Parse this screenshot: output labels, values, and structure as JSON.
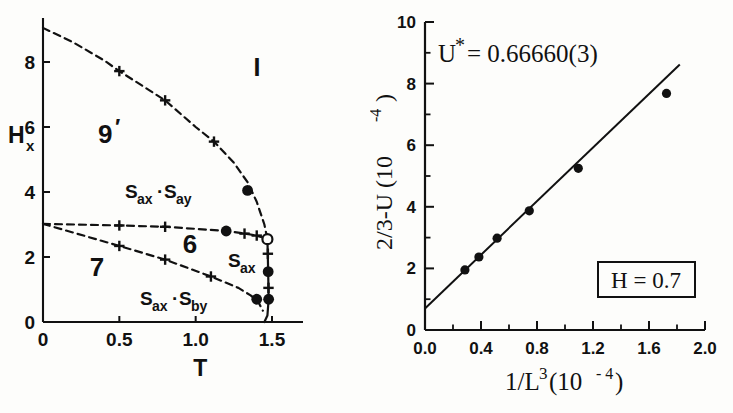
{
  "figure": {
    "panels": [
      "phase-diagram",
      "scaling-plot"
    ]
  },
  "left_panel": {
    "xlabel": "T",
    "ylabel_main": "H",
    "ylabel_sub": "x",
    "xticks": [
      "0",
      "0.5",
      "1.0",
      "1.5"
    ],
    "yticks": [
      "0",
      "2",
      "4",
      "6",
      "8"
    ],
    "regions": [
      {
        "name": "region-I",
        "label": "I"
      },
      {
        "name": "region-9prime",
        "label": "9",
        "prime": "′"
      },
      {
        "name": "region-sax-say",
        "label": "S",
        "sub1": "ax",
        "dot": "·",
        "label2": "S",
        "sub2": "ay"
      },
      {
        "name": "region-6",
        "label": "6"
      },
      {
        "name": "region-7",
        "label": "7"
      },
      {
        "name": "region-sax",
        "label": "S",
        "sub": "ax"
      },
      {
        "name": "region-sax-sby",
        "label": "S",
        "sub1": "ax",
        "dot": "·",
        "label2": "S",
        "sub2": "by"
      }
    ]
  },
  "right_panel": {
    "annotation_u": "U",
    "annotation_u_star": "*",
    "annotation_u_rest": " = 0.66660(3)",
    "boxed_label": "H = 0.7",
    "xticks": [
      "0.0",
      "0.4",
      "0.8",
      "1.2",
      "1.6",
      "2.0"
    ],
    "yticks": [
      "0",
      "2",
      "4",
      "6",
      "8",
      "10"
    ],
    "xlabel_main": "1/L",
    "xlabel_exp": "3",
    "xlabel_unit_open": " (10",
    "xlabel_unit_exp": "- 4",
    "xlabel_unit_close": " )",
    "ylabel_main": "2/3-U (10",
    "ylabel_exp": "-4",
    "ylabel_close": " )"
  },
  "chart_data": [
    {
      "type": "line",
      "name": "phase-diagram",
      "title": "",
      "xlabel": "T",
      "ylabel": "Hx",
      "xlim": [
        0.0,
        1.72
      ],
      "ylim": [
        0.0,
        9.6
      ],
      "xticks": [
        0.0,
        0.5,
        1.0,
        1.5
      ],
      "yticks": [
        0,
        2,
        4,
        6,
        8
      ],
      "grid": false,
      "legend": "none",
      "series": [
        {
          "name": "upper-boundary-9prime-I",
          "style": "dashed",
          "points": [
            [
              0.0,
              9.05
            ],
            [
              0.2,
              8.6
            ],
            [
              0.4,
              8.05
            ],
            [
              0.5,
              7.72
            ],
            [
              0.7,
              7.12
            ],
            [
              0.8,
              6.82
            ],
            [
              1.0,
              6.0
            ],
            [
              1.12,
              5.55
            ],
            [
              1.25,
              4.9
            ],
            [
              1.34,
              4.3
            ],
            [
              1.4,
              3.7
            ],
            [
              1.45,
              3.0
            ],
            [
              1.47,
              2.55
            ]
          ],
          "cross_markers": [
            [
              0.5,
              7.72
            ],
            [
              0.8,
              6.82
            ],
            [
              1.12,
              5.55
            ]
          ],
          "filled_markers": [
            [
              1.34,
              4.05
            ]
          ]
        },
        {
          "name": "middle-boundary-6",
          "style": "dashed",
          "points": [
            [
              0.0,
              3.02
            ],
            [
              0.5,
              2.97
            ],
            [
              0.8,
              2.93
            ],
            [
              1.2,
              2.8
            ],
            [
              1.32,
              2.72
            ],
            [
              1.4,
              2.66
            ],
            [
              1.47,
              2.55
            ]
          ],
          "cross_markers": [
            [
              0.5,
              2.97
            ],
            [
              0.8,
              2.93
            ],
            [
              1.32,
              2.72
            ],
            [
              1.4,
              2.66
            ]
          ],
          "filled_markers": [
            [
              1.2,
              2.8
            ]
          ]
        },
        {
          "name": "lower-boundary-7",
          "style": "dashed",
          "points": [
            [
              0.0,
              3.02
            ],
            [
              0.5,
              2.34
            ],
            [
              0.8,
              1.92
            ],
            [
              1.1,
              1.4
            ],
            [
              1.28,
              1.05
            ],
            [
              1.36,
              0.82
            ],
            [
              1.41,
              0.62
            ],
            [
              1.44,
              0.35
            ]
          ],
          "cross_markers": [
            [
              0.5,
              2.34
            ],
            [
              0.8,
              1.92
            ],
            [
              1.1,
              1.4
            ]
          ],
          "filled_markers": [
            [
              1.4,
              0.7
            ]
          ]
        },
        {
          "name": "critical-line-vertical",
          "style": "solid",
          "points": [
            [
              1.47,
              2.55
            ],
            [
              1.475,
              1.55
            ],
            [
              1.478,
              0.7
            ],
            [
              1.47,
              0.2
            ],
            [
              1.45,
              0.0
            ]
          ],
          "cross_markers": [
            [
              1.473,
              2.1
            ],
            [
              1.477,
              1.05
            ]
          ],
          "filled_markers": [
            [
              1.475,
              1.55
            ],
            [
              1.478,
              0.7
            ]
          ],
          "open_markers": [
            [
              1.47,
              2.55
            ]
          ]
        }
      ]
    },
    {
      "type": "scatter",
      "name": "scaling-plot",
      "title": "U* = 0.66660(3)",
      "xlabel": "1/L^3 (10^-4)",
      "ylabel": "2/3-U (10^-4)",
      "xlim": [
        0.0,
        2.0
      ],
      "ylim": [
        0.0,
        10.0
      ],
      "xticks": [
        0.0,
        0.4,
        0.8,
        1.2,
        1.6,
        2.0
      ],
      "yticks": [
        0,
        2,
        4,
        6,
        8,
        10
      ],
      "minor_xticks": [
        0.2,
        0.6,
        1.0,
        1.4,
        1.8
      ],
      "minor_yticks": [
        1,
        3,
        5,
        7,
        9
      ],
      "grid": false,
      "legend": "none",
      "x": [
        0.285,
        0.385,
        0.515,
        0.745,
        1.095,
        1.725
      ],
      "y": [
        1.95,
        2.37,
        2.98,
        3.87,
        5.25,
        7.68
      ],
      "fit_line": {
        "name": "linear-fit",
        "x": [
          0.0,
          1.82
        ],
        "y": [
          0.7,
          8.62
        ]
      },
      "annotations": [
        {
          "name": "u-star-annotation",
          "text": "U* = 0.66660(3)",
          "x": 0.25,
          "y": 9.1
        },
        {
          "name": "field-box",
          "text": "H = 0.7",
          "x": 1.55,
          "y": 1.25,
          "boxed": true
        }
      ]
    }
  ]
}
